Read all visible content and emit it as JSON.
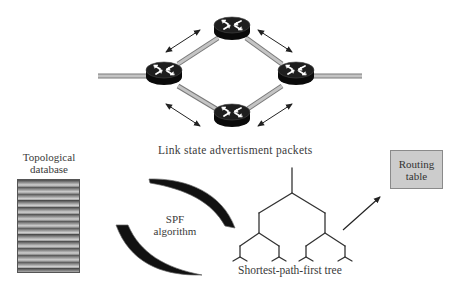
{
  "diagram": {
    "network": {
      "routers": [
        {
          "id": "router-top",
          "cx": 232,
          "cy": 29
        },
        {
          "id": "router-left",
          "cx": 164,
          "cy": 73
        },
        {
          "id": "router-right",
          "cx": 296,
          "cy": 73
        },
        {
          "id": "router-bottom",
          "cx": 232,
          "cy": 115
        }
      ],
      "caption": "Link state advertisment packets"
    },
    "topological_database": {
      "label_line1": "Topological",
      "label_line2": "database"
    },
    "spf_algorithm": {
      "label_line1": "SPF",
      "label_line2": "algorithm"
    },
    "spf_tree": {
      "caption": "Shortest-path-first tree"
    },
    "routing_table": {
      "label_line1": "Routing",
      "label_line2": "table"
    },
    "colors": {
      "router_body": "#151515",
      "link": "#b5b5b5",
      "arrow": "#222222",
      "routing_table_fill": "#cccccc",
      "tree_line": "#333333"
    }
  }
}
